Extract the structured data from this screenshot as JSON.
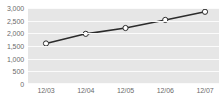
{
  "chart_data": {
    "type": "line",
    "title": "",
    "subtitle": "",
    "xlabel": "",
    "ylabel": "",
    "categories": [
      "12/03",
      "12/04",
      "12/05",
      "12/06",
      "12/07"
    ],
    "series": [
      {
        "name": "",
        "values": [
          1600,
          1980,
          2210,
          2530,
          2850
        ]
      }
    ],
    "ylim": [
      0,
      3000
    ],
    "yticks": [
      0,
      500,
      1000,
      1500,
      2000,
      2500,
      3000
    ],
    "ytick_labels": [
      "0",
      "500",
      "1,000",
      "1,500",
      "2,000",
      "2,500",
      "3,000"
    ],
    "xtick_labels": [
      "12/03",
      "12/04",
      "12/05",
      "12/06",
      "12/07"
    ],
    "grid": true,
    "grid_orientation": "horizontal",
    "legend": false,
    "legend_position": "none",
    "marker": "circle-open",
    "colors": {
      "plot_background": "#e6e6e6",
      "page_background": "#ffffff",
      "gridline": "#fbfbfb",
      "line": "#2b2b2b",
      "marker_fill": "#ffffff",
      "marker_stroke": "#2b2b2b",
      "tick_label": "#6b6b6b"
    }
  }
}
